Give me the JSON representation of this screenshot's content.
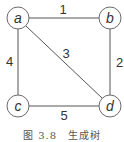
{
  "diagram": {
    "type": "weighted-graph",
    "nodes": [
      {
        "id": "a",
        "label": "a",
        "x": 18,
        "y": 18
      },
      {
        "id": "b",
        "label": "b",
        "x": 110,
        "y": 18
      },
      {
        "id": "c",
        "label": "c",
        "x": 18,
        "y": 106
      },
      {
        "id": "d",
        "label": "d",
        "x": 110,
        "y": 106
      }
    ],
    "edges": [
      {
        "from": "a",
        "to": "b",
        "weight": "1"
      },
      {
        "from": "b",
        "to": "d",
        "weight": "2"
      },
      {
        "from": "a",
        "to": "d",
        "weight": "3"
      },
      {
        "from": "a",
        "to": "c",
        "weight": "4"
      },
      {
        "from": "c",
        "to": "d",
        "weight": "5"
      }
    ],
    "caption": "图 3.8　生成树"
  }
}
